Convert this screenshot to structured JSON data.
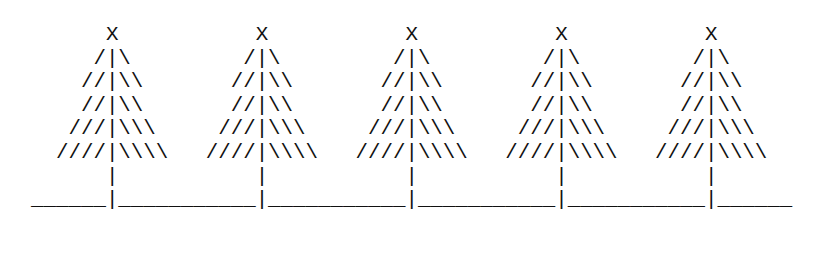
{
  "art": {
    "description": "Five ASCII-art pine trees standing on a ground line",
    "tree_count": 5,
    "text_color": "#111111",
    "background_color": "#ffffff",
    "lines": [
      "      X           X           X           X           X",
      "     /|\\         /|\\         /|\\         /|\\         /|\\",
      "    //|\\\\       //|\\\\       //|\\\\       //|\\\\       //|\\\\",
      "    //|\\\\       //|\\\\       //|\\\\       //|\\\\       //|\\\\",
      "   ///|\\\\\\     ///|\\\\\\     ///|\\\\\\     ///|\\\\\\     ///|\\\\\\",
      "  ////|\\\\\\\\   ////|\\\\\\\\   ////|\\\\\\\\   ////|\\\\\\\\   ////|\\\\\\\\",
      "      |           |           |           |           |",
      "______|___________|___________|___________|___________|______"
    ]
  }
}
